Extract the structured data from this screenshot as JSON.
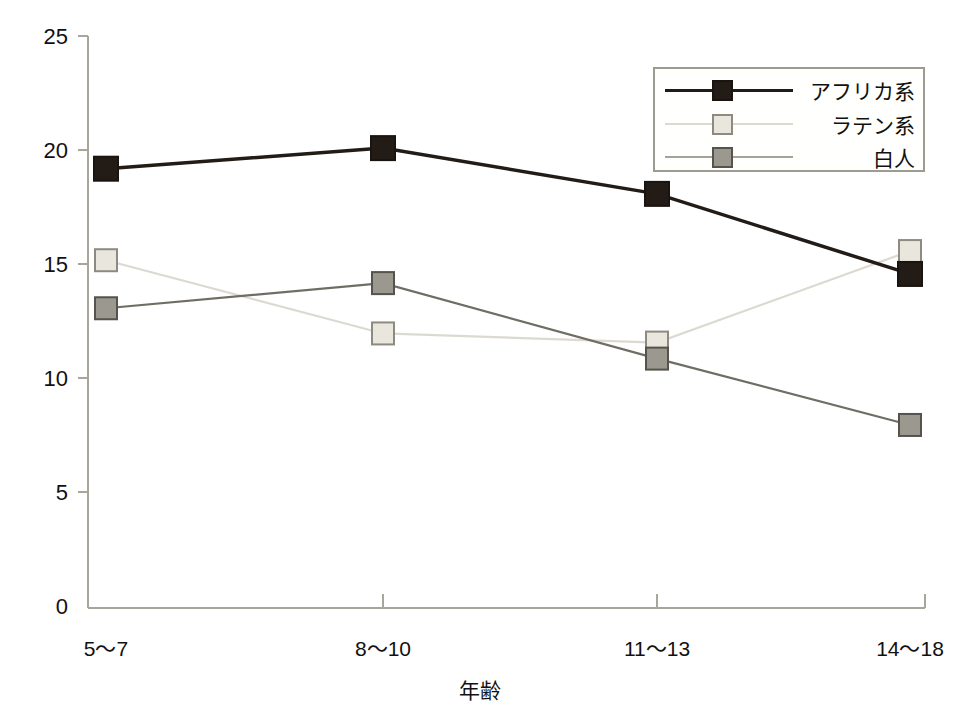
{
  "chart_data": {
    "type": "line",
    "title": "",
    "xlabel": "年齢",
    "ylabel": "ADHD Rating Scale-IVの合計スコア",
    "categories": [
      "5〜7",
      "8〜10",
      "11〜13",
      "14〜18"
    ],
    "ylim": [
      0,
      25
    ],
    "yticks": [
      0,
      5,
      10,
      15,
      20,
      25
    ],
    "ytick_labels": [
      "0",
      "5",
      "10",
      "15",
      "20",
      "25"
    ],
    "grid": false,
    "legend_position": "top-right",
    "series": [
      {
        "name": "アフリカ系",
        "values": [
          19.2,
          20.1,
          18.1,
          14.6
        ],
        "color": "#231b15",
        "marker": "filled-square",
        "marker_fill": "#231b15",
        "marker_edge": "#1a1410"
      },
      {
        "name": "ラテン系",
        "values": [
          15.2,
          12.0,
          11.6,
          15.6
        ],
        "color": "#dcdad0",
        "marker": "square",
        "marker_fill": "#e9e7dd",
        "marker_edge": "#8d8a80"
      },
      {
        "name": "白人",
        "values": [
          13.1,
          14.2,
          10.9,
          8.0
        ],
        "color": "#6f6d64",
        "marker": "square",
        "marker_fill": "#9b9890",
        "marker_edge": "#55534c"
      }
    ]
  },
  "axis": {
    "y_title": "ADHD Rating Scale-IVの合計スコア",
    "x_title": "年齢",
    "y_labels": [
      "25",
      "20",
      "15",
      "10",
      "5",
      "0"
    ],
    "x_labels": [
      "5〜7",
      "8〜10",
      "11〜13",
      "14〜18"
    ]
  },
  "legend": {
    "entries": [
      {
        "label": "アフリカ系"
      },
      {
        "label": "ラテン系"
      },
      {
        "label": "白人"
      }
    ]
  },
  "colors": {
    "background": "#ffffff",
    "axis": "#a8a59b",
    "text": "#111111",
    "series_african": "#231b15",
    "series_latino": "#dcdad0",
    "series_white": "#6f6d64"
  }
}
